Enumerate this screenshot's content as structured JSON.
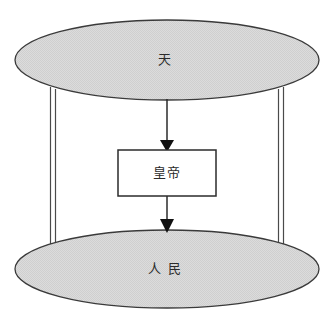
{
  "diagram": {
    "title": "",
    "background_color": "#ffffff",
    "canvas": {
      "width": 330,
      "height": 322
    },
    "style": {
      "ellipse_fill": "#d6d6d6",
      "ellipse_stroke": "#3a3a3a",
      "box_fill": "#ffffff",
      "box_stroke": "#2b2b2b",
      "connector_stroke": "#4a4a4a",
      "arrow_color": "#1a1a1a",
      "text_color": "#2b2b2b"
    },
    "nodes": [
      {
        "id": "heaven",
        "shape": "ellipse",
        "label": "天",
        "fill": "#d6d6d6",
        "cx": 167,
        "cy": 60,
        "rx": 152,
        "ry": 40
      },
      {
        "id": "emperor",
        "shape": "rectangle",
        "label": "皇帝",
        "fill": "#ffffff",
        "x": 118,
        "y": 150,
        "width": 98,
        "height": 46
      },
      {
        "id": "people",
        "shape": "ellipse",
        "label": "人 民",
        "fill": "#d6d6d6",
        "cx": 167,
        "cy": 269,
        "rx": 152,
        "ry": 39
      }
    ],
    "edges": [
      {
        "id": "heaven-to-emperor",
        "from": "heaven",
        "to": "emperor",
        "kind": "arrow",
        "direction": "down",
        "arrowhead": "solid-triangle"
      },
      {
        "id": "emperor-to-people",
        "from": "emperor",
        "to": "people",
        "kind": "arrow",
        "direction": "down",
        "arrowhead": "solid-triangle"
      },
      {
        "id": "heaven-to-people-left",
        "from": "heaven",
        "to": "people",
        "kind": "double-line",
        "direction": "none",
        "arrowhead": "none"
      },
      {
        "id": "heaven-to-people-right",
        "from": "heaven",
        "to": "people",
        "kind": "double-line",
        "direction": "none",
        "arrowhead": "none"
      }
    ]
  }
}
